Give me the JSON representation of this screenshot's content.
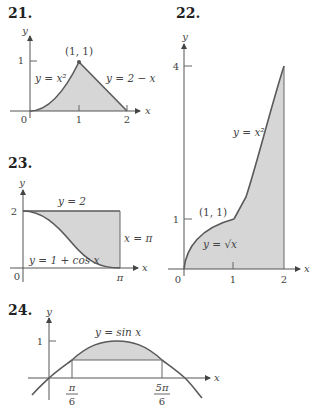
{
  "figure": {
    "colors": {
      "shading": "#d6d6d6",
      "curve": "#5a5a5a",
      "axis": "#555555"
    },
    "panels": [
      {
        "number": "21.",
        "axis_labels": {
          "x": "x",
          "y": "y"
        },
        "x_ticks": [
          "0",
          "1",
          "2"
        ],
        "y_ticks": [
          "1"
        ],
        "point_label": "(1, 1)",
        "curve_labels": [
          "y = x²",
          "y = 2 − x"
        ]
      },
      {
        "number": "22.",
        "axis_labels": {
          "x": "x",
          "y": "y"
        },
        "x_ticks": [
          "0",
          "1",
          "2"
        ],
        "y_ticks": [
          "1",
          "4"
        ],
        "point_label": "(1, 1)",
        "curve_labels": [
          "y = x²",
          "y = √x"
        ]
      },
      {
        "number": "23.",
        "axis_labels": {
          "x": "x",
          "y": "y"
        },
        "x_ticks": [
          "0",
          "π"
        ],
        "y_ticks": [
          "2"
        ],
        "curve_labels": [
          "y = 2",
          "x = π",
          "y = 1 + cos x"
        ]
      },
      {
        "number": "24.",
        "axis_labels": {
          "x": "x",
          "y": "y"
        },
        "x_ticks": [
          {
            "num": "π",
            "den": "6"
          },
          {
            "num": "5π",
            "den": "6"
          }
        ],
        "y_ticks": [
          "1"
        ],
        "curve_labels": [
          "y = sin x"
        ]
      }
    ]
  }
}
